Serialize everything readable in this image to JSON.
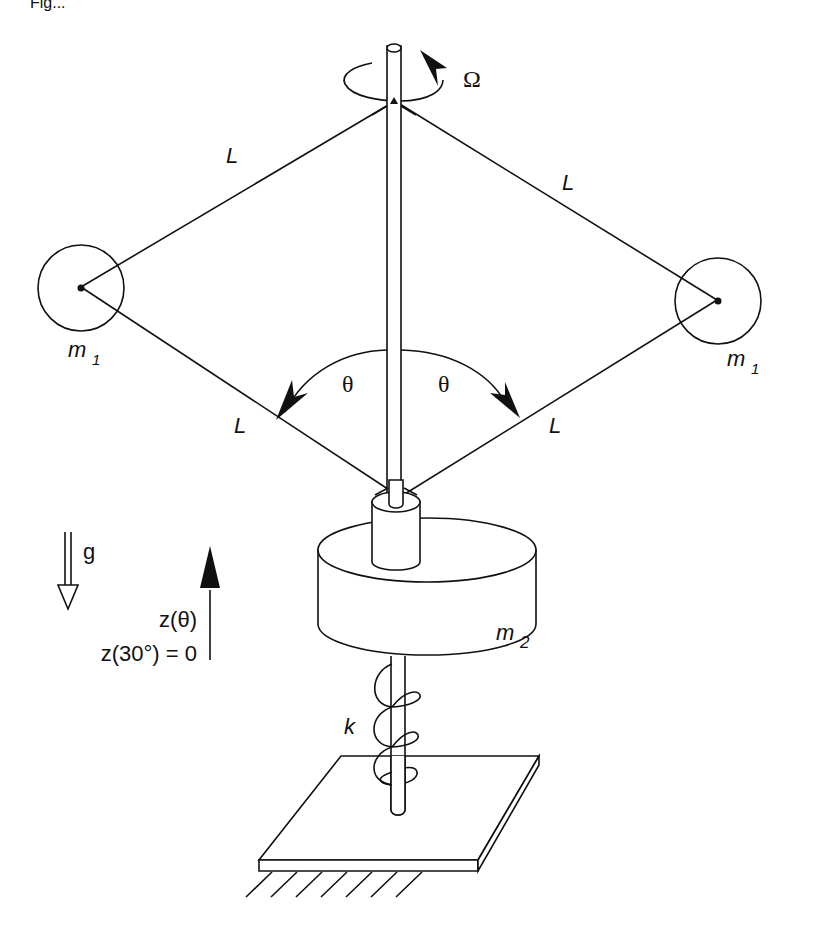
{
  "figure": {
    "caption_fragment": "Fig...",
    "labels": {
      "omega": "Ω",
      "link_length": "L",
      "mass_1": "m",
      "mass_1_sub": "1",
      "mass_2": "m",
      "mass_2_sub": "2",
      "theta": "θ",
      "gravity": "g",
      "z_theta": "z(θ)",
      "z_ref": "z(30°) = 0",
      "spring": "k"
    }
  }
}
